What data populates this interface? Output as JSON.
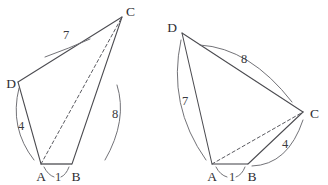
{
  "figure_set": {
    "title": "Two congruent-edge quadrilateral diagrams",
    "background_color": "#ffffff",
    "line_color": "#4b4b50",
    "label_color": "#2e2e33"
  },
  "figures": [
    {
      "name": "left-quadrilateral",
      "vertices": [
        {
          "id": "C",
          "label": "C",
          "x": 122,
          "y": 17,
          "label_x": 126,
          "label_y": 13
        },
        {
          "id": "D",
          "label": "D",
          "x": 18,
          "y": 82,
          "label_x": 7,
          "label_y": 85
        },
        {
          "id": "A",
          "label": "A",
          "x": 41,
          "y": 164,
          "label_x": 41,
          "label_y": 180
        },
        {
          "id": "B",
          "label": "B",
          "x": 72,
          "y": 164,
          "label_x": 75,
          "label_y": 180
        }
      ],
      "edges": [
        {
          "from": "D",
          "to": "C",
          "length_label": "7",
          "label_x": 68,
          "label_y": 38
        },
        {
          "from": "D",
          "to": "A",
          "length_label": "4",
          "label_x": 21,
          "label_y": 127
        },
        {
          "from": "A",
          "to": "B",
          "length_label": "1",
          "label_x": 58,
          "label_y": 180
        },
        {
          "from": "B",
          "to": "C",
          "length_label": "8",
          "label_x": 114,
          "label_y": 118
        }
      ],
      "diagonal": {
        "from": "A",
        "to": "C",
        "style": "dashed"
      }
    },
    {
      "name": "right-quadrilateral",
      "vertices": [
        {
          "id": "D",
          "label": "D",
          "x": 182,
          "y": 33,
          "label_x": 171,
          "label_y": 29
        },
        {
          "id": "C",
          "label": "C",
          "x": 303,
          "y": 112,
          "label_x": 308,
          "label_y": 115
        },
        {
          "id": "A",
          "label": "A",
          "x": 212,
          "y": 164,
          "label_x": 212,
          "label_y": 180
        },
        {
          "id": "B",
          "label": "B",
          "x": 248,
          "y": 164,
          "label_x": 251,
          "label_y": 180
        }
      ],
      "edges": [
        {
          "from": "D",
          "to": "C",
          "length_label": "8",
          "label_x": 245,
          "label_y": 62
        },
        {
          "from": "D",
          "to": "A",
          "length_label": "7",
          "label_x": 186,
          "label_y": 104
        },
        {
          "from": "A",
          "to": "B",
          "length_label": "1",
          "label_x": 232,
          "label_y": 180
        },
        {
          "from": "B",
          "to": "C",
          "length_label": "4",
          "label_x": 286,
          "label_y": 146
        }
      ],
      "diagonal": {
        "from": "A",
        "to": "C",
        "style": "dashed"
      }
    }
  ]
}
